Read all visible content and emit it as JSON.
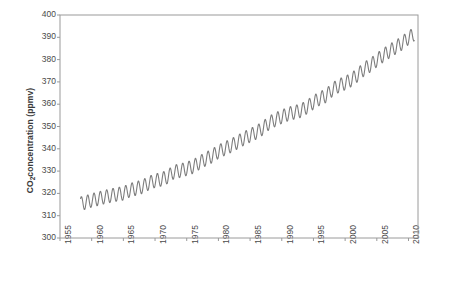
{
  "figure": {
    "background": "#ffffff",
    "line_color": "#7d7d7d",
    "axis_color": "#9a9a9a",
    "text_color": "#4a4a4a"
  },
  "axes": {
    "ylabel_main": "CO",
    "ylabel_sub": "2",
    "ylabel_rest": " concentration (ppmv)",
    "ylabel_full": "CO2 concentration (ppmv)",
    "yticks": [
      300,
      310,
      320,
      330,
      340,
      350,
      360,
      370,
      380,
      390,
      400
    ],
    "xticks": [
      1955,
      1960,
      1965,
      1970,
      1975,
      1980,
      1985,
      1990,
      1995,
      2000,
      2005,
      2010
    ],
    "ylim": [
      300,
      400
    ],
    "xlim": [
      1955,
      2011.5
    ],
    "grid": false,
    "legend": null
  },
  "chart_data": {
    "type": "line",
    "title": "",
    "xlabel": "",
    "ylabel": "CO2 concentration (ppmv)",
    "xlim": [
      1955,
      2011.5
    ],
    "ylim": [
      300,
      400
    ],
    "grid": false,
    "legend_position": "none",
    "seasonal_amplitude_ppmv": 3.1,
    "series": [
      {
        "name": "Atmospheric CO2",
        "color": "#7d7d7d",
        "annual_mean": {
          "x": [
            1958,
            1959,
            1960,
            1961,
            1962,
            1963,
            1964,
            1965,
            1966,
            1967,
            1968,
            1969,
            1970,
            1971,
            1972,
            1973,
            1974,
            1975,
            1976,
            1977,
            1978,
            1979,
            1980,
            1981,
            1982,
            1983,
            1984,
            1985,
            1986,
            1987,
            1988,
            1989,
            1990,
            1991,
            1992,
            1993,
            1994,
            1995,
            1996,
            1997,
            1998,
            1999,
            2000,
            2001,
            2002,
            2003,
            2004,
            2005,
            2006,
            2007,
            2008,
            2009,
            2010,
            2011
          ],
          "y": [
            315.3,
            315.9,
            316.9,
            317.6,
            318.4,
            319.0,
            319.6,
            320.0,
            321.4,
            322.2,
            323.0,
            324.6,
            325.7,
            326.3,
            327.5,
            329.7,
            330.2,
            331.1,
            332.0,
            333.8,
            335.4,
            336.8,
            338.7,
            340.1,
            341.4,
            343.0,
            344.6,
            346.0,
            347.4,
            349.2,
            351.6,
            353.1,
            354.4,
            355.6,
            356.4,
            357.1,
            358.8,
            360.8,
            362.6,
            363.8,
            366.6,
            368.3,
            369.5,
            371.0,
            373.2,
            375.8,
            377.5,
            379.8,
            381.9,
            383.8,
            385.6,
            387.4,
            389.8,
            391.6
          ]
        }
      }
    ]
  }
}
